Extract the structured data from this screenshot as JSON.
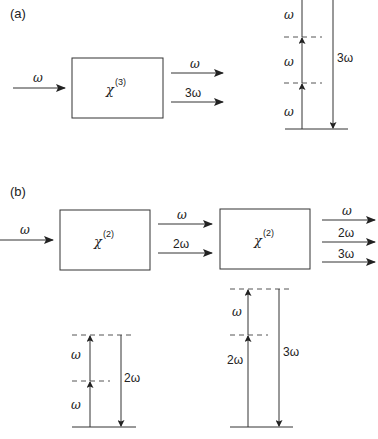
{
  "panel_a": {
    "label": "(a)",
    "input": {
      "label": "ω"
    },
    "crystal": {
      "symbol": "χ",
      "order": "(3)"
    },
    "outputs": [
      {
        "label": "ω"
      },
      {
        "label": "3ω"
      }
    ],
    "energy_diagram": {
      "up_steps": [
        {
          "label": "ω"
        },
        {
          "label": "ω"
        },
        {
          "label": "ω"
        }
      ],
      "down": {
        "label": "3ω"
      }
    }
  },
  "panel_b": {
    "label": "(b)",
    "input": {
      "label": "ω"
    },
    "crystal1": {
      "symbol": "χ",
      "order": "(2)"
    },
    "middle": [
      {
        "label": "ω"
      },
      {
        "label": "2ω"
      }
    ],
    "crystal2": {
      "symbol": "χ",
      "order": "(2)"
    },
    "outputs": [
      {
        "label": "ω"
      },
      {
        "label": "2ω"
      },
      {
        "label": "3ω"
      }
    ],
    "energy_diagram_shg": {
      "up_steps": [
        {
          "label": "ω"
        },
        {
          "label": "ω"
        }
      ],
      "down": {
        "label": "2ω"
      }
    },
    "energy_diagram_sfg": {
      "up_steps": [
        {
          "label": "2ω"
        },
        {
          "label": "ω"
        }
      ],
      "down": {
        "label": "3ω"
      }
    }
  }
}
